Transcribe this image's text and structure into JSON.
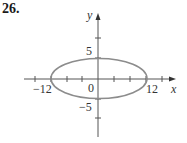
{
  "problem_number": "26.",
  "axes": {
    "x_label": "x",
    "y_label": "y",
    "origin_label": "0",
    "x_tick_labels": [
      "−12",
      "12"
    ],
    "y_tick_labels": [
      "5",
      "−5"
    ]
  },
  "curve": {
    "type": "ellipse",
    "center": [
      0,
      0
    ],
    "semi_major_x": 12,
    "semi_minor_y": 5,
    "stroke_color": "#8c8c8c"
  },
  "colors": {
    "axis": "#555555",
    "curve": "#8c8c8c"
  }
}
